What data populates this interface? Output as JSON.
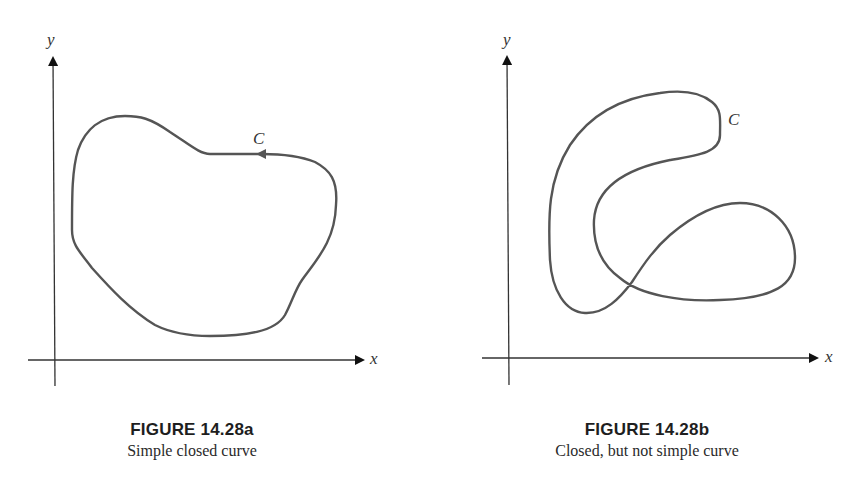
{
  "figure_a": {
    "number": "FIGURE 14.28a",
    "caption": "Simple closed curve",
    "x_axis_label": "x",
    "y_axis_label": "y",
    "curve_label": "C",
    "curve_has_direction_arrow": true
  },
  "figure_b": {
    "number": "FIGURE 14.28b",
    "caption": "Closed, but not simple curve",
    "x_axis_label": "x",
    "y_axis_label": "y",
    "curve_label": "C",
    "curve_has_direction_arrow": false
  },
  "colors": {
    "curve": "#555555",
    "axis": "#222222",
    "background": "#ffffff"
  }
}
